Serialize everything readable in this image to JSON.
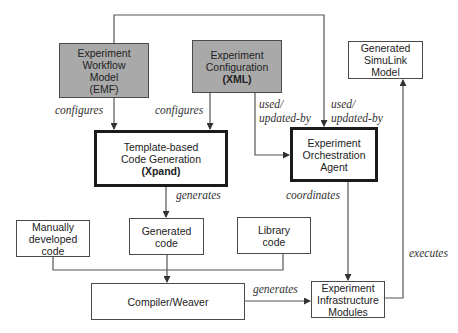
{
  "diagram": {
    "nodes": {
      "workflow": {
        "line1": "Experiment",
        "line2": "Workflow",
        "line3": "Model",
        "line4": "(EMF)",
        "fill": "#a9a9a9"
      },
      "config": {
        "line1": "Experiment",
        "line2": "Configuration",
        "line3": "(XML)",
        "fill": "#a9a9a9"
      },
      "simulink": {
        "line1": "Generated",
        "line2": "SimuLink",
        "line3": "Model"
      },
      "template": {
        "line1": "Template-based",
        "line2": "Code Generation",
        "line3": "(Xpand)"
      },
      "orchestration": {
        "line1": "Experiment",
        "line2": "Orchestration",
        "line3": "Agent"
      },
      "manual": {
        "line1": "Manually",
        "line2": "developed",
        "line3": "code"
      },
      "generated": {
        "line1": "Generated",
        "line2": "code"
      },
      "library": {
        "line1": "Library",
        "line2": "code"
      },
      "compiler": {
        "line1": "Compiler/Weaver"
      },
      "infrastructure": {
        "line1": "Experiment",
        "line2": "Infrastructure",
        "line3": "Modules"
      }
    },
    "edges": {
      "workflow_configures": "configures",
      "config_configures": "configures",
      "config_used_l1": "used/",
      "config_used_l2": "updated-by",
      "workflow_used_l1": "used/",
      "workflow_used_l2": "updated-by",
      "template_generates": "generates",
      "orch_coordinates": "coordinates",
      "compiler_generates": "generates",
      "infra_executes": "executes"
    }
  }
}
